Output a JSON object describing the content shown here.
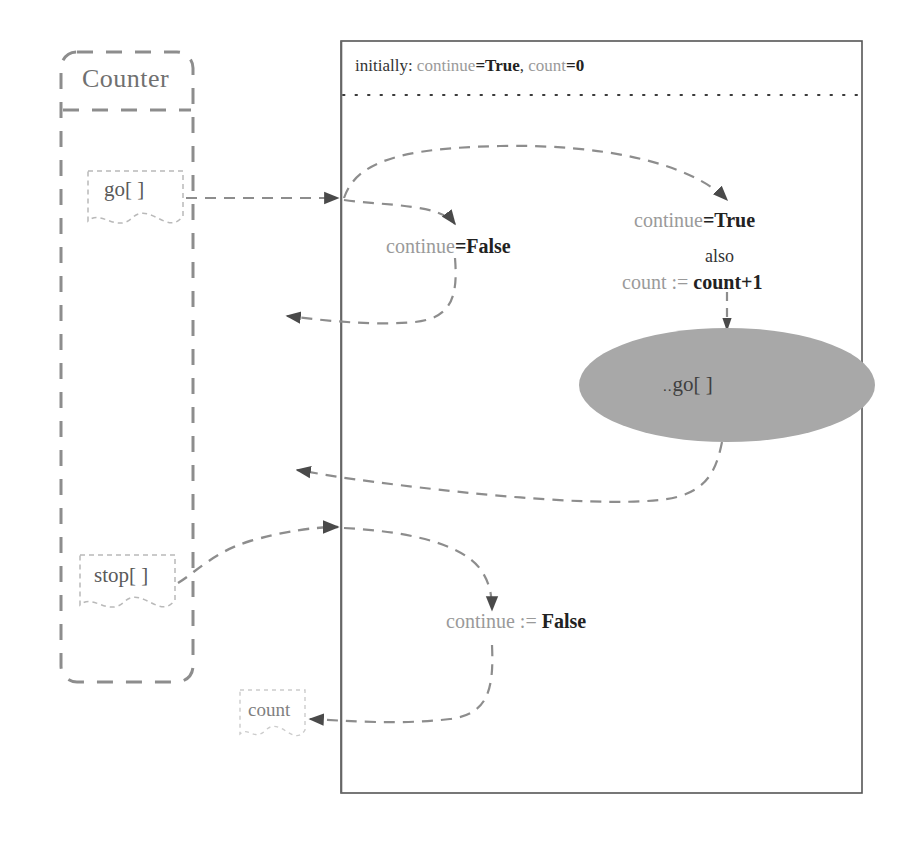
{
  "diagram": {
    "type": "sequence-diagram"
  },
  "lifeline": {
    "name": "Counter",
    "notes": [
      {
        "id": "go-note",
        "label": "go[ ]"
      },
      {
        "id": "stop-note",
        "label": "stop[ ]"
      },
      {
        "id": "count-note",
        "label": "count"
      }
    ]
  },
  "frame": {
    "initially": {
      "prefix": "initially:",
      "var1_name": "continue",
      "var1_value": "=True",
      "separator": ",",
      "var2_name": "count",
      "var2_value": "=0"
    }
  },
  "statements": [
    {
      "id": "guard-continue-false",
      "name_part": "continue",
      "op_part": "=False"
    },
    {
      "id": "guard-continue-true",
      "name_part": "continue",
      "op_part": "=True"
    },
    {
      "id": "also-keyword",
      "text": "also"
    },
    {
      "id": "assign-count",
      "name_part": "count :=",
      "op_part": "count+1"
    },
    {
      "id": "assign-continue-false",
      "name_part": "continue :=",
      "op_part": "False"
    }
  ],
  "ellipse": {
    "id": "self-call-go",
    "prefix": "..",
    "label": "go[ ]",
    "fill": "#a8a8a8"
  },
  "colors": {
    "frame_border": "#555555",
    "dashed_gray": "#8d8d8d",
    "lifeline_solid": "#666666",
    "note_border": "#b9b9b9",
    "ellipse_fill": "#a8a8a8",
    "text_gray": "#9a9a9a",
    "text_dark": "#222222"
  }
}
